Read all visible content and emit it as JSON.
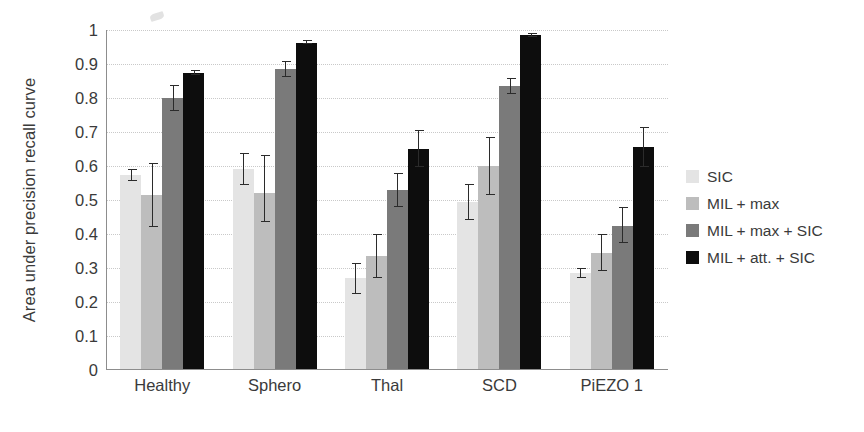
{
  "chart_data": {
    "type": "bar",
    "title": "",
    "xlabel": "",
    "ylabel": "Area under precision recall curve",
    "ylim": [
      0,
      1
    ],
    "ytick_labels": [
      "1",
      "0.9",
      "0.8",
      "0.7",
      "0.6",
      "0.5",
      "0.4",
      "0.3",
      "0.2",
      "0.1",
      "0"
    ],
    "ytick_values": [
      1,
      0.9,
      0.8,
      0.7,
      0.6,
      0.5,
      0.4,
      0.3,
      0.2,
      0.1,
      0
    ],
    "grid": true,
    "legend_position": "right",
    "categories": [
      "Healthy",
      "Sphero",
      "Thal",
      "SCD",
      "PiEZO 1"
    ],
    "series": [
      {
        "name": "SIC",
        "color": "#e4e4e4",
        "values": [
          0.575,
          0.59,
          0.27,
          0.495,
          0.285
        ],
        "err_low": [
          0.555,
          0.545,
          0.225,
          0.44,
          0.272
        ],
        "err_high": [
          0.592,
          0.637,
          0.315,
          0.548,
          0.3
        ]
      },
      {
        "name": "MIL + max",
        "color": "#bdbdbd",
        "values": [
          0.515,
          0.52,
          0.335,
          0.6,
          0.345
        ],
        "err_low": [
          0.42,
          0.435,
          0.27,
          0.515,
          0.29
        ],
        "err_high": [
          0.608,
          0.632,
          0.4,
          0.685,
          0.4
        ]
      },
      {
        "name": "MIL + max + SIC",
        "color": "#7a7a7a",
        "values": [
          0.8,
          0.885,
          0.53,
          0.835,
          0.425
        ],
        "err_low": [
          0.762,
          0.862,
          0.478,
          0.812,
          0.375
        ],
        "err_high": [
          0.838,
          0.908,
          0.578,
          0.858,
          0.478
        ]
      },
      {
        "name": "MIL + att. + SIC",
        "color": "#0d0d0d",
        "values": [
          0.875,
          0.963,
          0.65,
          0.985,
          0.655
        ],
        "err_low": [
          0.868,
          0.958,
          0.598,
          0.978,
          0.598
        ],
        "err_high": [
          0.882,
          0.97,
          0.705,
          0.992,
          0.715
        ]
      }
    ]
  },
  "legend": {
    "items": [
      {
        "label": "SIC"
      },
      {
        "label": "MIL + max"
      },
      {
        "label": "MIL + max + SIC"
      },
      {
        "label": "MIL + att. + SIC"
      }
    ]
  },
  "axes": {
    "y_title": "Area under precision recall curve"
  }
}
